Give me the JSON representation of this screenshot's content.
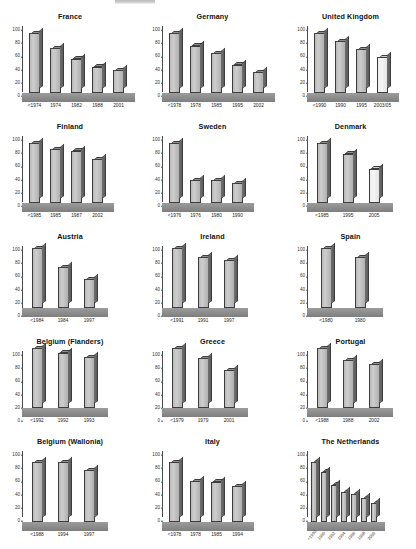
{
  "figure": {
    "layout": "3x5 small multiples",
    "panel_count": 15
  },
  "chart_data": [
    {
      "type": "bar",
      "title": "France",
      "categories": [
        "<1974",
        "1974",
        "1982",
        "1988",
        "2001"
      ],
      "values": [
        100,
        75,
        57,
        44,
        38
      ],
      "yticks": [
        "100",
        "80",
        "60",
        "40",
        "20",
        "0"
      ],
      "ylim": [
        0,
        110
      ],
      "xlabel": "",
      "ylabel": "",
      "grid": false,
      "highlight_index": -1
    },
    {
      "type": "bar",
      "title": "Germany",
      "categories": [
        "<1978",
        "1978",
        "1985",
        "1995",
        "2002"
      ],
      "values": [
        100,
        79,
        66,
        47,
        35
      ],
      "yticks": [
        "100",
        "80",
        "60",
        "40",
        "20",
        "0"
      ],
      "ylim": [
        0,
        110
      ],
      "xlabel": "",
      "ylabel": "",
      "grid": false,
      "highlight_index": -1
    },
    {
      "type": "bar",
      "title": "United Kingdom",
      "categories": [
        "<1990",
        "1990",
        "1995",
        "2003/05"
      ],
      "values": [
        100,
        86,
        73,
        60
      ],
      "yticks": [
        "100",
        "80",
        "60",
        "40",
        "20",
        "0"
      ],
      "ylim": [
        0,
        110
      ],
      "xlabel": "",
      "ylabel": "",
      "grid": false,
      "highlight_index": 3
    },
    {
      "type": "bar",
      "title": "Finland",
      "categories": [
        "<1985",
        "1985",
        "1987",
        "2002"
      ],
      "values": [
        100,
        90,
        87,
        73
      ],
      "yticks": [
        "100",
        "80",
        "60",
        "40",
        "20",
        "0"
      ],
      "ylim": [
        0,
        110
      ],
      "xlabel": "",
      "ylabel": "",
      "grid": false,
      "highlight_index": -1
    },
    {
      "type": "bar",
      "title": "Sweden",
      "categories": [
        "<1976",
        "1976",
        "1980",
        "1990"
      ],
      "values": [
        100,
        38,
        38,
        33
      ],
      "yticks": [
        "100",
        "80",
        "60",
        "40",
        "20",
        "0"
      ],
      "ylim": [
        0,
        110
      ],
      "xlabel": "",
      "ylabel": "",
      "grid": false,
      "highlight_index": -1
    },
    {
      "type": "bar",
      "title": "Denmark",
      "categories": [
        "<1985",
        "1995",
        "2005"
      ],
      "values": [
        100,
        82,
        57
      ],
      "yticks": [
        "100",
        "80",
        "60",
        "40",
        "20",
        "0"
      ],
      "ylim": [
        0,
        110
      ],
      "xlabel": "",
      "ylabel": "",
      "grid": false,
      "highlight_index": 2
    },
    {
      "type": "bar",
      "title": "Austria",
      "categories": [
        "<1984",
        "1984",
        "1997"
      ],
      "values": [
        100,
        68,
        48
      ],
      "yticks": [
        "100",
        "80",
        "60",
        "40",
        "20",
        "0"
      ],
      "ylim": [
        0,
        110
      ],
      "xlabel": "",
      "ylabel": "",
      "grid": false,
      "highlight_index": -1
    },
    {
      "type": "bar",
      "title": "Ireland",
      "categories": [
        "<1991",
        "1991",
        "1997"
      ],
      "values": [
        100,
        85,
        80
      ],
      "yticks": [
        "100",
        "80",
        "60",
        "40",
        "20",
        "0"
      ],
      "ylim": [
        0,
        110
      ],
      "xlabel": "",
      "ylabel": "",
      "grid": false,
      "highlight_index": -1
    },
    {
      "type": "bar",
      "title": "Spain",
      "categories": [
        "<1980",
        "1980"
      ],
      "values": [
        100,
        85
      ],
      "yticks": [
        "100",
        "80",
        "60",
        "40",
        "20",
        "0"
      ],
      "ylim": [
        0,
        110
      ],
      "xlabel": "",
      "ylabel": "",
      "grid": false,
      "highlight_index": -1
    },
    {
      "type": "bar",
      "title": "Belgium (Flanders)",
      "categories": [
        "<1992",
        "1992",
        "1993"
      ],
      "values": [
        100,
        92,
        85
      ],
      "yticks": [
        "100",
        "80",
        "60",
        "40",
        "20",
        "0"
      ],
      "ylim": [
        0,
        110
      ],
      "xlabel": "",
      "ylabel": "",
      "grid": false,
      "highlight_index": -1
    },
    {
      "type": "bar",
      "title": "Greece",
      "categories": [
        "<1979",
        "1979",
        "2001"
      ],
      "values": [
        100,
        83,
        63
      ],
      "yticks": [
        "100",
        "80",
        "60",
        "40",
        "20",
        "0"
      ],
      "ylim": [
        0,
        110
      ],
      "xlabel": "",
      "ylabel": "",
      "grid": false,
      "highlight_index": -1
    },
    {
      "type": "bar",
      "title": "Portugal",
      "categories": [
        "<1988",
        "1988",
        "2002"
      ],
      "values": [
        100,
        80,
        73
      ],
      "yticks": [
        "100",
        "80",
        "60",
        "40",
        "20",
        "0"
      ],
      "ylim": [
        0,
        110
      ],
      "xlabel": "",
      "ylabel": "",
      "grid": false,
      "highlight_index": -1
    },
    {
      "type": "bar",
      "title": "Belgium (Wallonia)",
      "categories": [
        "<1988",
        "1994",
        "1997"
      ],
      "values": [
        100,
        100,
        86
      ],
      "yticks": [
        "100",
        "80",
        "60",
        "40",
        "20",
        "0"
      ],
      "ylim": [
        0,
        110
      ],
      "xlabel": "",
      "ylabel": "",
      "grid": false,
      "highlight_index": -1
    },
    {
      "type": "bar",
      "title": "Italy",
      "categories": [
        "<1978",
        "1978",
        "1985",
        "1994"
      ],
      "values": [
        100,
        68,
        67,
        60
      ],
      "yticks": [
        "100",
        "80",
        "60",
        "40",
        "20",
        "0"
      ],
      "ylim": [
        0,
        110
      ],
      "xlabel": "",
      "ylabel": "",
      "grid": false,
      "highlight_index": -1
    },
    {
      "type": "bar",
      "title": "The Netherlands",
      "categories": [
        "<1990",
        "1990",
        "1992",
        "1994",
        "1996",
        "1998",
        "2000"
      ],
      "values": [
        100,
        84,
        62,
        50,
        46,
        40,
        31
      ],
      "yticks": [
        "100",
        "80",
        "60",
        "40",
        "20",
        "0"
      ],
      "ylim": [
        0,
        110
      ],
      "xlabel": "",
      "ylabel": "",
      "grid": false,
      "highlight_index": -1,
      "rotated_labels": true
    }
  ]
}
